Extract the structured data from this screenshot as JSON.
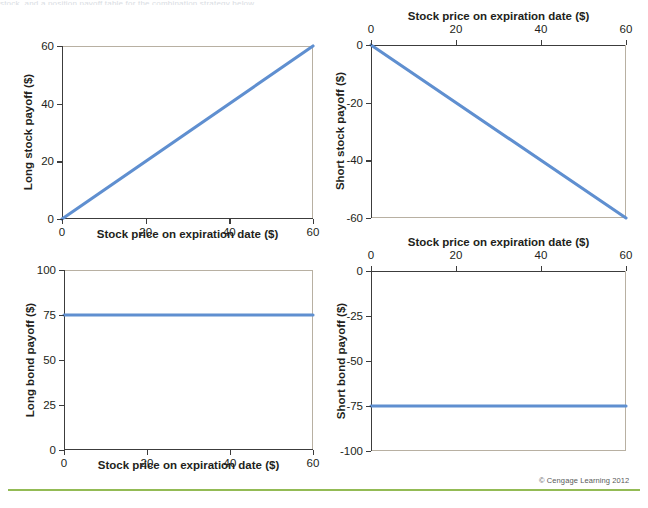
{
  "figure": {
    "top_sliver_text": "stock, and a position payoff table for the combination strategy below",
    "copyright": "© Cengage Learning 2012",
    "line_color": "#5f8fd0",
    "frame_light_color": "#b8b0a2",
    "frame_dark_color": "#3c3c3c",
    "rule_color": "#93bb55",
    "shared_xlabel": "Stock price on expiration date ($)"
  },
  "chart_data": [
    {
      "id": "long-stock",
      "type": "line",
      "title": "",
      "xlabel": "Stock price on expiration date ($)",
      "ylabel": "Long stock payoff ($)",
      "xlabel_position": "bottom",
      "xlim": [
        0,
        60
      ],
      "ylim": [
        0,
        60
      ],
      "xticks": [
        0,
        20,
        40,
        60
      ],
      "yticks": [
        0,
        20,
        40,
        60
      ],
      "xticklabels": [
        "0",
        "20",
        "40",
        "60"
      ],
      "yticklabels": [
        "0",
        "20",
        "40",
        "60"
      ],
      "grid": false,
      "legend": "none",
      "series": [
        {
          "name": "Long stock payoff",
          "x": [
            0,
            60
          ],
          "values": [
            0,
            60
          ]
        }
      ]
    },
    {
      "id": "short-stock",
      "type": "line",
      "title": "",
      "xlabel": "Stock price on expiration date ($)",
      "ylabel": "Short stock payoff ($)",
      "xlabel_position": "top",
      "xlim": [
        0,
        60
      ],
      "ylim": [
        -60,
        0
      ],
      "xticks": [
        0,
        20,
        40,
        60
      ],
      "yticks": [
        0,
        -20,
        -40,
        -60
      ],
      "xticklabels": [
        "0",
        "20",
        "40",
        "60"
      ],
      "yticklabels": [
        "0",
        "-20",
        "-40",
        "-60"
      ],
      "grid": false,
      "legend": "none",
      "series": [
        {
          "name": "Short stock payoff",
          "x": [
            0,
            60
          ],
          "values": [
            0,
            -60
          ]
        }
      ]
    },
    {
      "id": "long-bond",
      "type": "line",
      "title": "",
      "xlabel": "Stock price on expiration date ($)",
      "ylabel": "Long bond payoff ($)",
      "xlabel_position": "bottom",
      "xlim": [
        0,
        60
      ],
      "ylim": [
        0,
        100
      ],
      "xticks": [
        0,
        20,
        40,
        60
      ],
      "yticks": [
        0,
        25,
        50,
        75,
        100
      ],
      "xticklabels": [
        "0",
        "20",
        "40",
        "60"
      ],
      "yticklabels": [
        "0",
        "25",
        "50",
        "75",
        "100"
      ],
      "grid": false,
      "legend": "none",
      "series": [
        {
          "name": "Long bond payoff",
          "x": [
            0,
            60
          ],
          "values": [
            75,
            75
          ]
        }
      ]
    },
    {
      "id": "short-bond",
      "type": "line",
      "title": "",
      "xlabel": "Stock price on expiration date ($)",
      "ylabel": "Short bond payoff ($)",
      "xlabel_position": "top",
      "xlim": [
        0,
        60
      ],
      "ylim": [
        -100,
        0
      ],
      "xticks": [
        0,
        20,
        40,
        60
      ],
      "yticks": [
        0,
        -25,
        -50,
        -75,
        -100
      ],
      "xticklabels": [
        "0",
        "20",
        "40",
        "60"
      ],
      "yticklabels": [
        "0",
        "-25",
        "-50",
        "-75",
        "-100"
      ],
      "grid": false,
      "legend": "none",
      "series": [
        {
          "name": "Short bond payoff",
          "x": [
            0,
            60
          ],
          "values": [
            -75,
            -75
          ]
        }
      ]
    }
  ]
}
